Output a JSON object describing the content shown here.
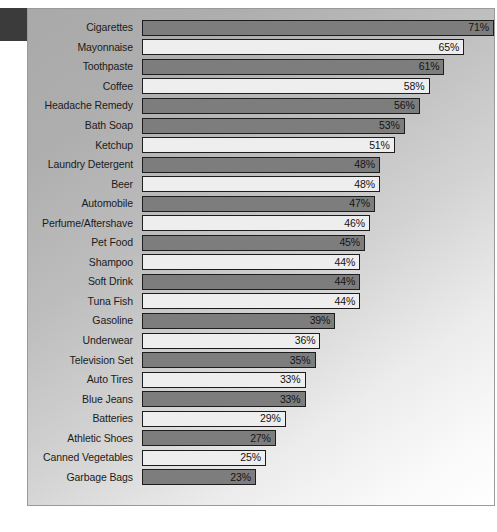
{
  "chart_data": {
    "type": "bar",
    "orientation": "horizontal",
    "title": "",
    "subtitle": "",
    "xlabel": "",
    "ylabel": "",
    "grid": false,
    "legend": "none",
    "axis_visible": false,
    "tick_labels": [],
    "xlim": [
      0,
      71
    ],
    "value_suffix": "%",
    "categories": [
      "Cigarettes",
      "Mayonnaise",
      "Toothpaste",
      "Coffee",
      "Headache Remedy",
      "Bath Soap",
      "Ketchup",
      "Laundry Detergent",
      "Beer",
      "Automobile",
      "Perfume/Aftershave",
      "Pet Food",
      "Shampoo",
      "Soft Drink",
      "Tuna Fish",
      "Gasoline",
      "Underwear",
      "Television Set",
      "Auto Tires",
      "Blue Jeans",
      "Batteries",
      "Athletic Shoes",
      "Canned Vegetables",
      "Garbage Bags"
    ],
    "values": [
      71,
      65,
      61,
      58,
      56,
      53,
      51,
      48,
      48,
      47,
      46,
      45,
      44,
      44,
      44,
      39,
      36,
      35,
      33,
      33,
      29,
      27,
      25,
      23
    ],
    "value_labels": [
      "71%",
      "65%",
      "61%",
      "58%",
      "56%",
      "53%",
      "51%",
      "48%",
      "48%",
      "47%",
      "46%",
      "45%",
      "44%",
      "44%",
      "44%",
      "39%",
      "36%",
      "35%",
      "33%",
      "33%",
      "29%",
      "27%",
      "25%",
      "23%"
    ],
    "bar_fills": [
      "dark",
      "light",
      "dark",
      "light",
      "dark",
      "dark",
      "light",
      "dark",
      "light",
      "dark",
      "light",
      "dark",
      "light",
      "dark",
      "light",
      "dark",
      "light",
      "dark",
      "light",
      "dark",
      "light",
      "dark",
      "light",
      "dark"
    ]
  },
  "colors": {
    "bar_dark": "#7d7d7d",
    "bar_light": "#eeeeee",
    "bar_outline": "#1d1d1d",
    "label_text": "#1b1b1b",
    "panel_border": "#9a9a9a",
    "corner_block": "#3b3b3b",
    "page_background": "#ffffff"
  }
}
